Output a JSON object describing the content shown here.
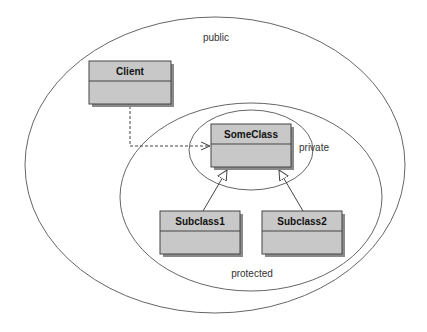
{
  "diagram": {
    "scopes": [
      {
        "id": "public",
        "label": "public"
      },
      {
        "id": "protected",
        "label": "protected"
      },
      {
        "id": "private",
        "label": "private"
      }
    ],
    "classes": [
      {
        "id": "client",
        "name": "Client"
      },
      {
        "id": "someclass",
        "name": "SomeClass"
      },
      {
        "id": "subclass1",
        "name": "Subclass1"
      },
      {
        "id": "subclass2",
        "name": "Subclass2"
      }
    ],
    "relations": [
      {
        "type": "dependency",
        "from": "Client",
        "to": "SomeClass"
      },
      {
        "type": "inheritance",
        "from": "Subclass1",
        "to": "SomeClass"
      },
      {
        "type": "inheritance",
        "from": "Subclass2",
        "to": "SomeClass"
      }
    ],
    "colors": {
      "box_fill": "#c8c8c8",
      "box_shadow": "#8a8a8a",
      "stroke": "#555555",
      "background": "#ffffff"
    }
  }
}
